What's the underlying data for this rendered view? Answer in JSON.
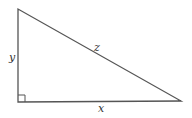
{
  "diagram": {
    "type": "right-triangle",
    "labels": {
      "vertical_leg": "y",
      "horizontal_leg": "x",
      "hypotenuse": "z"
    },
    "right_angle_marker": true,
    "colors": {
      "stroke": "#555555",
      "label": "#333333"
    }
  }
}
